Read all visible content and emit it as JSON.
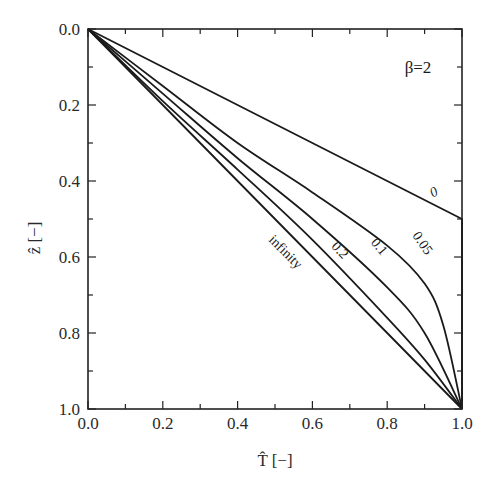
{
  "chart_data": {
    "type": "line",
    "title": "",
    "annotation": "β=2",
    "xlabel": "T̂ [−]",
    "ylabel": "ẑ [−]",
    "xlim": [
      0.0,
      1.0
    ],
    "ylim": [
      1.0,
      0.0
    ],
    "y_inverted": true,
    "grid": false,
    "legend": "inline curve labels",
    "x_ticks": [
      "0.0",
      "0.2",
      "0.4",
      "0.6",
      "0.8",
      "1.0"
    ],
    "y_ticks": [
      "0.0",
      "0.2",
      "0.4",
      "0.6",
      "0.8",
      "1.0"
    ],
    "series": [
      {
        "name": "0",
        "x": [
          0.0,
          0.2,
          0.4,
          0.6,
          0.8,
          1.0,
          1.0
        ],
        "y": [
          0.0,
          0.1,
          0.2,
          0.3,
          0.4,
          0.5,
          1.0
        ]
      },
      {
        "name": "0.05",
        "x": [
          0.0,
          0.2,
          0.4,
          0.6,
          0.8,
          0.9,
          0.95,
          1.0
        ],
        "y": [
          0.0,
          0.15,
          0.3,
          0.43,
          0.57,
          0.67,
          0.78,
          1.0
        ]
      },
      {
        "name": "0.1",
        "x": [
          0.0,
          0.2,
          0.4,
          0.6,
          0.8,
          0.9,
          1.0
        ],
        "y": [
          0.0,
          0.17,
          0.34,
          0.5,
          0.68,
          0.8,
          1.0
        ]
      },
      {
        "name": "0.2",
        "x": [
          0.0,
          0.2,
          0.4,
          0.6,
          0.8,
          0.9,
          1.0
        ],
        "y": [
          0.0,
          0.19,
          0.37,
          0.555,
          0.76,
          0.87,
          1.0
        ]
      },
      {
        "name": "infinity",
        "x": [
          0.0,
          0.2,
          0.4,
          0.6,
          0.8,
          1.0
        ],
        "y": [
          0.0,
          0.2,
          0.4,
          0.6,
          0.8,
          1.0
        ]
      }
    ],
    "curve_labels": [
      {
        "text": "0",
        "x": 0.93,
        "y": 0.44,
        "rotate": -28
      },
      {
        "text": "0.05",
        "x": 0.885,
        "y": 0.57,
        "rotate": 55
      },
      {
        "text": "0.1",
        "x": 0.77,
        "y": 0.58,
        "rotate": 50
      },
      {
        "text": "0.2",
        "x": 0.665,
        "y": 0.59,
        "rotate": 47
      },
      {
        "text": "infinity",
        "x": 0.52,
        "y": 0.595,
        "rotate": 45
      }
    ]
  }
}
